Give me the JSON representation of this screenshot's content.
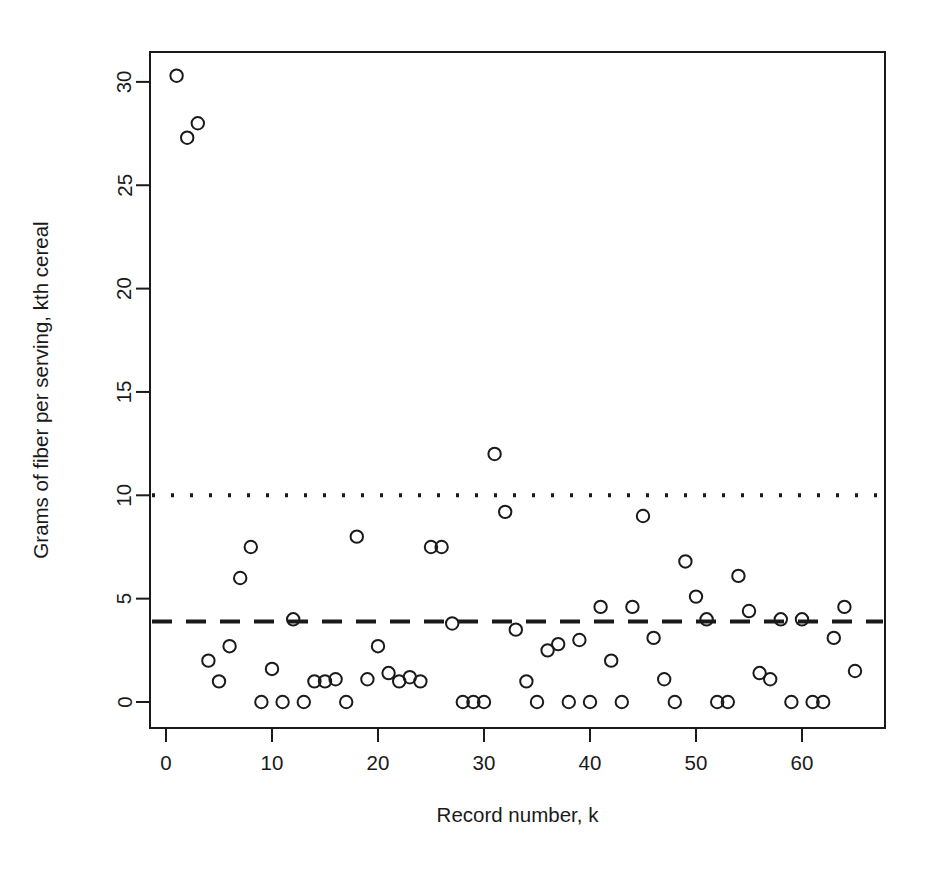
{
  "chart_data": {
    "type": "scatter",
    "title": "",
    "xlabel": "Record number, k",
    "ylabel": "Grams of fiber per serving, kth cereal",
    "xlim": [
      -1.5,
      68.5
    ],
    "ylim": [
      -1.2,
      31.5
    ],
    "xticks": [
      0,
      10,
      20,
      30,
      40,
      50,
      60
    ],
    "yticks": [
      0,
      5,
      10,
      15,
      20,
      25,
      30
    ],
    "grid": false,
    "legend": null,
    "marker": "open-circle",
    "marker_color": "#1a1a1a",
    "background_color": "#ffffff",
    "frame": "box",
    "x": [
      1,
      2,
      3,
      4,
      5,
      6,
      7,
      8,
      9,
      10,
      11,
      12,
      13,
      14,
      15,
      16,
      17,
      18,
      19,
      20,
      21,
      22,
      23,
      24,
      25,
      26,
      27,
      28,
      29,
      30,
      31,
      32,
      33,
      34,
      35,
      36,
      37,
      38,
      39,
      40,
      41,
      42,
      43,
      44,
      45,
      46,
      47,
      48,
      49,
      50,
      51,
      52,
      53,
      54,
      55,
      56,
      57,
      58,
      59,
      60,
      61,
      62,
      63,
      64,
      65
    ],
    "y": [
      30.3,
      27.3,
      28.0,
      2.0,
      1.0,
      2.7,
      6.0,
      7.5,
      0.0,
      1.6,
      0.0,
      4.0,
      0.0,
      1.0,
      1.0,
      1.1,
      0.0,
      8.0,
      1.1,
      2.7,
      1.4,
      1.0,
      1.2,
      1.0,
      7.5,
      7.5,
      3.8,
      0.0,
      0.0,
      0.0,
      12.0,
      9.2,
      3.5,
      1.0,
      0.0,
      2.5,
      2.8,
      0.0,
      3.0,
      0.0,
      4.6,
      2.0,
      0.0,
      4.6,
      9.0,
      3.1,
      1.1,
      0.0,
      6.8,
      5.1,
      4.0,
      0.0,
      0.0,
      6.1,
      4.4,
      1.4,
      1.1,
      4.0,
      0.0,
      4.0,
      0.0,
      0.0,
      3.1,
      4.6,
      1.5
    ],
    "reference_lines": [
      {
        "name": "dotted-reference-line",
        "y": 10.0,
        "style": "dotted",
        "color": "#1a1a1a",
        "width": 4
      },
      {
        "name": "dashed-reference-line",
        "y": 3.9,
        "style": "dashed",
        "color": "#1a1a1a",
        "width": 4
      }
    ]
  }
}
